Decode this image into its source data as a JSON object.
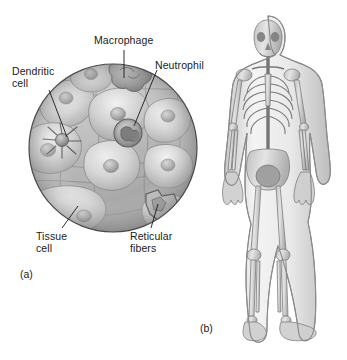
{
  "figure": {
    "background_color": "#ffffff",
    "ink_color": "#1a1a1a",
    "panels": [
      {
        "tag": "(a)",
        "name": "tissue-microscopic-view",
        "description": "Circular cutaway view of connective tissue showing tissue cells, reticular fibers, and resident immune cells"
      },
      {
        "tag": "(b)",
        "name": "whole-body-view",
        "description": "Anterior view of a human body with the skeleton visible through translucent skin"
      }
    ]
  },
  "panel_a": {
    "tag": "(a)",
    "labels": {
      "macrophage": "Macrophage",
      "neutrophil": "Neutrophil",
      "dendritic_cell": "Dendritic\ncell",
      "tissue_cell": "Tissue\ncell",
      "reticular_fibers": "Reticular\nfibers"
    },
    "circle": {
      "center_x": 113,
      "center_y": 148,
      "radius": 84,
      "outline_color": "#4a4a4a",
      "fill_color": "#c9c9c9"
    },
    "cell_fill_light": "#e2e2e2",
    "cell_fill_mid": "#c5c5c5",
    "cell_fill_dark": "#9a9a9a",
    "nucleus_color": "#a8a8a8",
    "immune_cell_color": "#8f8f8f"
  },
  "panel_b": {
    "tag": "(b)",
    "body_fill": "#ededed",
    "body_outline": "#8a8a8a",
    "bone_fill": "#d0d0d0",
    "bone_outline": "#6e6e6e"
  }
}
